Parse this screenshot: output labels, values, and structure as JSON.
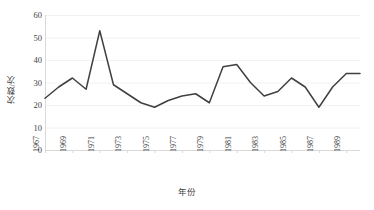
{
  "chart_data": {
    "type": "line",
    "title": "",
    "xlabel": "年份",
    "ylabel": "次数/次",
    "x": [
      1967,
      1968,
      1969,
      1970,
      1971,
      1972,
      1973,
      1974,
      1975,
      1976,
      1977,
      1978,
      1979,
      1980,
      1981,
      1982,
      1983,
      1984,
      1985,
      1986,
      1987,
      1988,
      1989,
      1990
    ],
    "values": [
      23,
      28,
      32,
      27,
      53,
      29,
      25,
      21,
      19,
      22,
      24,
      25,
      21,
      37,
      38,
      30,
      24,
      26,
      32,
      28,
      19,
      28,
      34,
      34
    ],
    "series": [
      {
        "name": "次数",
        "values": [
          23,
          28,
          32,
          27,
          53,
          29,
          25,
          21,
          19,
          22,
          24,
          25,
          21,
          37,
          38,
          30,
          24,
          26,
          32,
          28,
          19,
          28,
          34,
          34
        ]
      }
    ],
    "xlim": [
      1967,
      1990
    ],
    "ylim": [
      0,
      60
    ],
    "y_ticks": [
      0,
      10,
      20,
      30,
      40,
      50,
      60
    ],
    "x_tick_labels": [
      "1967",
      "1969",
      "1971",
      "1973",
      "1975",
      "1977",
      "1979",
      "1981",
      "1983",
      "1985",
      "1987",
      "1989"
    ],
    "x_tick_values": [
      1967,
      1969,
      1971,
      1973,
      1975,
      1977,
      1979,
      1981,
      1983,
      1985,
      1987,
      1989
    ],
    "grid": "horizontal",
    "legend": "none",
    "line_color": "#404040",
    "grid_color": "#f2f2f2",
    "axis_color": "#d9d9d9",
    "text_color": "#3f3f3f",
    "markers": false
  }
}
